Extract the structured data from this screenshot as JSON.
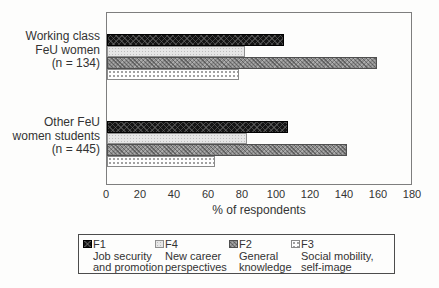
{
  "chart_data": {
    "type": "bar",
    "orientation": "horizontal",
    "title": "",
    "xlabel": "% of respondents",
    "xlim": [
      0,
      180
    ],
    "xticks": [
      0,
      20,
      40,
      60,
      80,
      100,
      120,
      140,
      160,
      180
    ],
    "grid": false,
    "legend_position": "bottom",
    "series": [
      {
        "code": "F1",
        "label": "Job security and promotion",
        "label_lines": [
          "Job security",
          "and promotion"
        ],
        "pattern": "black-weave",
        "color": "#141414"
      },
      {
        "code": "F4",
        "label": "New career perspectives",
        "label_lines": [
          "New career",
          "perspectives"
        ],
        "pattern": "light-dotted",
        "color": "#e6e6e6"
      },
      {
        "code": "F2",
        "label": "General knowledge",
        "label_lines": [
          "General",
          "knowledge"
        ],
        "pattern": "gray-checker",
        "color": "#8d8d8d"
      },
      {
        "code": "F3",
        "label": "Social mobility, self-image",
        "label_lines": [
          "Social mobility,",
          "self-image"
        ],
        "pattern": "white-dotted",
        "color": "#fefefe"
      }
    ],
    "groups": [
      {
        "label": "Working class FeU women (n = 134)",
        "label_lines": [
          "Working class",
          "FeU women",
          "(n = 134)"
        ],
        "values": [
          105,
          82,
          160,
          78
        ]
      },
      {
        "label": "Other FeU women students (n = 445)",
        "label_lines": [
          "Other FeU",
          "women students",
          "(n = 445)"
        ],
        "values": [
          107,
          83,
          142,
          64
        ]
      }
    ]
  }
}
